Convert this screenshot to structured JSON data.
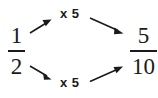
{
  "diagram": {
    "type": "equivalent-fraction-diagram",
    "background_color": "#ffffff",
    "ink_color": "#1a1a1a",
    "left_fraction": {
      "numerator": "1",
      "denominator": "2",
      "label": "1/2"
    },
    "right_fraction": {
      "numerator": "5",
      "denominator": "10",
      "label": "5/10"
    },
    "operations": {
      "top": {
        "text": "x 5",
        "applies_to": "numerator",
        "from": "1",
        "to": "5"
      },
      "bottom": {
        "text": "x 5",
        "applies_to": "denominator",
        "from": "2",
        "to": "10"
      }
    },
    "arrows": [
      {
        "name": "top-left-arrow",
        "direction": "up-right",
        "from": [
          30,
          32
        ],
        "to": [
          51,
          20
        ]
      },
      {
        "name": "top-right-arrow",
        "direction": "down-right",
        "from": [
          90,
          18
        ],
        "to": [
          122,
          33
        ]
      },
      {
        "name": "bottom-left-arrow",
        "direction": "down-right",
        "from": [
          30,
          66
        ],
        "to": [
          51,
          79
        ]
      },
      {
        "name": "bottom-right-arrow",
        "direction": "up-right",
        "from": [
          90,
          81
        ],
        "to": [
          122,
          66
        ]
      }
    ]
  }
}
